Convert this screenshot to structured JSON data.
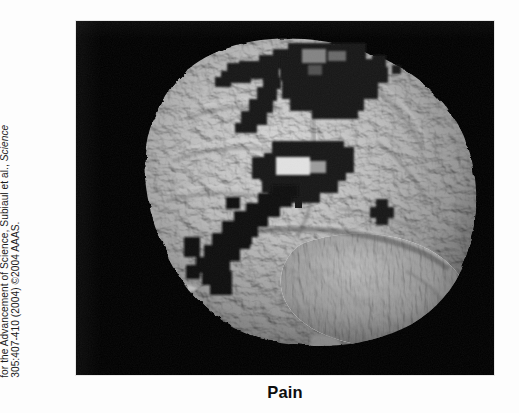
{
  "figure": {
    "caption": "Pain",
    "panel": {
      "background_color": "#000000",
      "modality": "fMRI statistical activation map on a 3-D rendered brain surface",
      "view": "left lateral sagittal surface rendering",
      "surface_color": "#b9b9b9",
      "activation_color": "#1a1a1a",
      "activation_clusters": [
        {
          "name": "superior-frontal-premotor-cluster",
          "label": "superior frontal / premotor",
          "position": "upper-left of cortex, dorsal convexity"
        },
        {
          "name": "superior-parietal-cluster",
          "label": "superior parietal / postcentral",
          "position": "upper-middle, along the dorsal midline edge"
        },
        {
          "name": "inferior-parietal-cluster",
          "label": "inferior parietal / supramarginal",
          "position": "middle of cortex"
        },
        {
          "name": "insula-operculum-cluster",
          "label": "frontal operculum / anterior insula",
          "position": "lower-left, descending diagonal chain"
        },
        {
          "name": "posterior-temporal-spot",
          "label": "posterior temporal focus",
          "position": "small cross-shaped focus, right of center"
        }
      ]
    },
    "credit": {
      "line1": "Reprinted with permission from The American Association",
      "line2_prefix": "for the Advancement of Science, Subiaul et al., ",
      "line2_italic": "Science",
      "line3": "305:407-410 (2004) ©2004 AAAS."
    }
  }
}
